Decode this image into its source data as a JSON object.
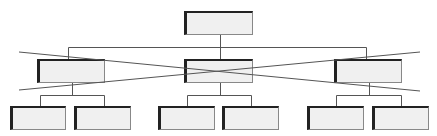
{
  "diagram": {
    "type": "org-chart",
    "levels": 3,
    "annotation": "crossed-out middle level",
    "colors": {
      "box_fill": "#f0f0f0",
      "box_border_dark": "#222222",
      "box_border_light": "#888888",
      "line": "#555555"
    },
    "nodes": [
      {
        "id": "root",
        "level": 0,
        "label": "",
        "x": 184,
        "y": 11,
        "w": 69,
        "h": 24
      },
      {
        "id": "mid-left",
        "level": 1,
        "label": "",
        "x": 37,
        "y": 59,
        "w": 68,
        "h": 24
      },
      {
        "id": "mid-center",
        "level": 1,
        "label": "",
        "x": 184,
        "y": 59,
        "w": 69,
        "h": 24
      },
      {
        "id": "mid-right",
        "level": 1,
        "label": "",
        "x": 334,
        "y": 59,
        "w": 68,
        "h": 24
      },
      {
        "id": "leaf-1",
        "level": 2,
        "label": "",
        "x": 10,
        "y": 106,
        "w": 56,
        "h": 24
      },
      {
        "id": "leaf-2",
        "level": 2,
        "label": "",
        "x": 74,
        "y": 106,
        "w": 57,
        "h": 24
      },
      {
        "id": "leaf-3",
        "level": 2,
        "label": "",
        "x": 158,
        "y": 106,
        "w": 57,
        "h": 24
      },
      {
        "id": "leaf-4",
        "level": 2,
        "label": "",
        "x": 222,
        "y": 106,
        "w": 57,
        "h": 24
      },
      {
        "id": "leaf-5",
        "level": 2,
        "label": "",
        "x": 307,
        "y": 106,
        "w": 57,
        "h": 24
      },
      {
        "id": "leaf-6",
        "level": 2,
        "label": "",
        "x": 372,
        "y": 106,
        "w": 57,
        "h": 24
      }
    ],
    "cross_lines": [
      {
        "x1": 19,
        "y1": 52,
        "x2": 420,
        "y2": 91
      },
      {
        "x1": 19,
        "y1": 90,
        "x2": 420,
        "y2": 52
      }
    ]
  }
}
